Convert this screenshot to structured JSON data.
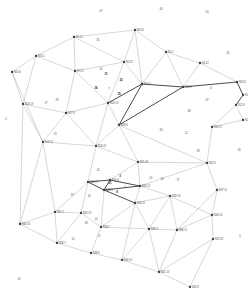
{
  "figure": {
    "kind": "planar-triangulated-graph",
    "background_color": "#ffffff",
    "edge_color": "#a8a8a8",
    "edge_color_highlight": "#2b2b2b",
    "node_color": "#3a3a3a",
    "label_color": "#4a4a4a",
    "width": 248,
    "height": 307
  },
  "chart_data": {
    "type": "scatter",
    "title": "",
    "xlabel": "",
    "ylabel": "",
    "grid": false,
    "legend": "none",
    "xlim": [
      0,
      248
    ],
    "ylim": [
      0,
      307
    ],
    "nodes": [
      {
        "id": 0,
        "label": "N0:20",
        "x": 135,
        "y": 30
      },
      {
        "id": 1,
        "label": "N1:12",
        "x": 74,
        "y": 37
      },
      {
        "id": 2,
        "label": "N2:4",
        "x": 166,
        "y": 52
      },
      {
        "id": 3,
        "label": "N3:11",
        "x": 36,
        "y": 56
      },
      {
        "id": 4,
        "label": "N4:22",
        "x": 200,
        "y": 63
      },
      {
        "id": 5,
        "label": "N5:22",
        "x": 124,
        "y": 62
      },
      {
        "id": 6,
        "label": "N6:16",
        "x": 12,
        "y": 72
      },
      {
        "id": 7,
        "label": "N7:21",
        "x": 75,
        "y": 71
      },
      {
        "id": 8,
        "label": "N8:16",
        "x": 237,
        "y": 82
      },
      {
        "id": 9,
        "label": "N9:10",
        "x": 142,
        "y": 84
      },
      {
        "id": 10,
        "label": "N10:17",
        "x": 243,
        "y": 95
      },
      {
        "id": 11,
        "label": "N11:9",
        "x": 183,
        "y": 87
      },
      {
        "id": 12,
        "label": "N12:9",
        "x": 236,
        "y": 105
      },
      {
        "id": 13,
        "label": "N13:13",
        "x": 23,
        "y": 104
      },
      {
        "id": 14,
        "label": "N14:19",
        "x": 108,
        "y": 103
      },
      {
        "id": 15,
        "label": "N15:25",
        "x": 243,
        "y": 120
      },
      {
        "id": 16,
        "label": "N16:17",
        "x": 212,
        "y": 127
      },
      {
        "id": 17,
        "label": "N17:8",
        "x": 66,
        "y": 113
      },
      {
        "id": 18,
        "label": "N18:6",
        "x": 119,
        "y": 125
      },
      {
        "id": 19,
        "label": "N19:15",
        "x": 43,
        "y": 142
      },
      {
        "id": 20,
        "label": "N20:22",
        "x": 96,
        "y": 146
      },
      {
        "id": 21,
        "label": "N21:20",
        "x": 138,
        "y": 162
      },
      {
        "id": 22,
        "label": "N22:5",
        "x": 207,
        "y": 163
      },
      {
        "id": 23,
        "label": "N23:17",
        "x": 88,
        "y": 182
      },
      {
        "id": 24,
        "label": "N24:4",
        "x": 110,
        "y": 180
      },
      {
        "id": 25,
        "label": "N25:9",
        "x": 104,
        "y": 190
      },
      {
        "id": 26,
        "label": "N26:12",
        "x": 140,
        "y": 186
      },
      {
        "id": 27,
        "label": "N27:11",
        "x": 217,
        "y": 190
      },
      {
        "id": 28,
        "label": "N28:18",
        "x": 170,
        "y": 196
      },
      {
        "id": 29,
        "label": "N29:21",
        "x": 135,
        "y": 203
      },
      {
        "id": 30,
        "label": "N30:14",
        "x": 212,
        "y": 215
      },
      {
        "id": 31,
        "label": "N31:2",
        "x": 55,
        "y": 212
      },
      {
        "id": 32,
        "label": "N32:13",
        "x": 81,
        "y": 213
      },
      {
        "id": 33,
        "label": "N33:7",
        "x": 101,
        "y": 227
      },
      {
        "id": 34,
        "label": "N34:16",
        "x": 20,
        "y": 224
      },
      {
        "id": 35,
        "label": "N35:3",
        "x": 149,
        "y": 229
      },
      {
        "id": 36,
        "label": "N36:11",
        "x": 177,
        "y": 230
      },
      {
        "id": 37,
        "label": "N37:22",
        "x": 213,
        "y": 239
      },
      {
        "id": 38,
        "label": "N38:7",
        "x": 57,
        "y": 243
      },
      {
        "id": 39,
        "label": "N39:9",
        "x": 91,
        "y": 253
      },
      {
        "id": 40,
        "label": "N40:10",
        "x": 122,
        "y": 260
      },
      {
        "id": 41,
        "label": "N41:23",
        "x": 159,
        "y": 272
      },
      {
        "id": 42,
        "label": "N42:8",
        "x": 190,
        "y": 287
      }
    ],
    "edges": [
      {
        "from": 0,
        "to": 1,
        "weight": 1
      },
      {
        "from": 0,
        "to": 2,
        "weight": 1
      },
      {
        "from": 0,
        "to": 5,
        "weight": 1
      },
      {
        "from": 0,
        "to": 9,
        "weight": 1
      },
      {
        "from": 1,
        "to": 3,
        "weight": 1
      },
      {
        "from": 1,
        "to": 5,
        "weight": 1
      },
      {
        "from": 1,
        "to": 7,
        "weight": 1
      },
      {
        "from": 2,
        "to": 4,
        "weight": 1
      },
      {
        "from": 2,
        "to": 9,
        "weight": 1
      },
      {
        "from": 2,
        "to": 11,
        "weight": 1
      },
      {
        "from": 3,
        "to": 6,
        "weight": 1
      },
      {
        "from": 3,
        "to": 7,
        "weight": 1
      },
      {
        "from": 3,
        "to": 13,
        "weight": 1
      },
      {
        "from": 4,
        "to": 8,
        "weight": 1
      },
      {
        "from": 4,
        "to": 11,
        "weight": 1
      },
      {
        "from": 5,
        "to": 7,
        "weight": 1
      },
      {
        "from": 5,
        "to": 9,
        "weight": 1
      },
      {
        "from": 5,
        "to": 14,
        "weight": 1
      },
      {
        "from": 6,
        "to": 13,
        "weight": 1
      },
      {
        "from": 7,
        "to": 14,
        "weight": 1
      },
      {
        "from": 7,
        "to": 17,
        "weight": 1
      },
      {
        "from": 8,
        "to": 10,
        "weight": 2
      },
      {
        "from": 8,
        "to": 11,
        "weight": 2
      },
      {
        "from": 9,
        "to": 11,
        "weight": 2
      },
      {
        "from": 9,
        "to": 14,
        "weight": 2
      },
      {
        "from": 9,
        "to": 18,
        "weight": 2
      },
      {
        "from": 10,
        "to": 12,
        "weight": 2
      },
      {
        "from": 11,
        "to": 18,
        "weight": 2
      },
      {
        "from": 12,
        "to": 15,
        "weight": 1
      },
      {
        "from": 12,
        "to": 16,
        "weight": 1
      },
      {
        "from": 13,
        "to": 17,
        "weight": 1
      },
      {
        "from": 13,
        "to": 19,
        "weight": 1
      },
      {
        "from": 14,
        "to": 17,
        "weight": 1
      },
      {
        "from": 14,
        "to": 18,
        "weight": 1
      },
      {
        "from": 14,
        "to": 20,
        "weight": 1
      },
      {
        "from": 15,
        "to": 16,
        "weight": 1
      },
      {
        "from": 16,
        "to": 22,
        "weight": 1
      },
      {
        "from": 17,
        "to": 19,
        "weight": 1
      },
      {
        "from": 17,
        "to": 20,
        "weight": 1
      },
      {
        "from": 18,
        "to": 20,
        "weight": 1
      },
      {
        "from": 18,
        "to": 21,
        "weight": 1
      },
      {
        "from": 18,
        "to": 22,
        "weight": 1
      },
      {
        "from": 19,
        "to": 20,
        "weight": 1
      },
      {
        "from": 19,
        "to": 31,
        "weight": 1
      },
      {
        "from": 19,
        "to": 34,
        "weight": 1
      },
      {
        "from": 20,
        "to": 21,
        "weight": 1
      },
      {
        "from": 20,
        "to": 23,
        "weight": 1
      },
      {
        "from": 21,
        "to": 22,
        "weight": 1
      },
      {
        "from": 21,
        "to": 24,
        "weight": 1
      },
      {
        "from": 21,
        "to": 26,
        "weight": 1
      },
      {
        "from": 22,
        "to": 26,
        "weight": 1
      },
      {
        "from": 22,
        "to": 27,
        "weight": 1
      },
      {
        "from": 23,
        "to": 24,
        "weight": 2
      },
      {
        "from": 23,
        "to": 25,
        "weight": 2
      },
      {
        "from": 23,
        "to": 32,
        "weight": 1
      },
      {
        "from": 24,
        "to": 25,
        "weight": 2
      },
      {
        "from": 24,
        "to": 26,
        "weight": 2
      },
      {
        "from": 25,
        "to": 26,
        "weight": 2
      },
      {
        "from": 25,
        "to": 29,
        "weight": 2
      },
      {
        "from": 25,
        "to": 33,
        "weight": 1
      },
      {
        "from": 26,
        "to": 28,
        "weight": 1
      },
      {
        "from": 26,
        "to": 29,
        "weight": 1
      },
      {
        "from": 27,
        "to": 30,
        "weight": 1
      },
      {
        "from": 27,
        "to": 36,
        "weight": 1
      },
      {
        "from": 28,
        "to": 29,
        "weight": 1
      },
      {
        "from": 28,
        "to": 30,
        "weight": 1
      },
      {
        "from": 28,
        "to": 35,
        "weight": 1
      },
      {
        "from": 28,
        "to": 36,
        "weight": 1
      },
      {
        "from": 29,
        "to": 33,
        "weight": 1
      },
      {
        "from": 29,
        "to": 35,
        "weight": 1
      },
      {
        "from": 30,
        "to": 36,
        "weight": 1
      },
      {
        "from": 30,
        "to": 37,
        "weight": 1
      },
      {
        "from": 31,
        "to": 32,
        "weight": 1
      },
      {
        "from": 31,
        "to": 34,
        "weight": 1
      },
      {
        "from": 31,
        "to": 38,
        "weight": 1
      },
      {
        "from": 32,
        "to": 33,
        "weight": 1
      },
      {
        "from": 32,
        "to": 38,
        "weight": 1
      },
      {
        "from": 33,
        "to": 39,
        "weight": 1
      },
      {
        "from": 34,
        "to": 38,
        "weight": 1
      },
      {
        "from": 35,
        "to": 36,
        "weight": 1
      },
      {
        "from": 35,
        "to": 40,
        "weight": 1
      },
      {
        "from": 35,
        "to": 41,
        "weight": 1
      },
      {
        "from": 36,
        "to": 41,
        "weight": 1
      },
      {
        "from": 37,
        "to": 41,
        "weight": 1
      },
      {
        "from": 37,
        "to": 42,
        "weight": 1
      },
      {
        "from": 38,
        "to": 39,
        "weight": 1
      },
      {
        "from": 39,
        "to": 40,
        "weight": 1
      },
      {
        "from": 40,
        "to": 41,
        "weight": 1
      },
      {
        "from": 41,
        "to": 42,
        "weight": 1
      },
      {
        "from": 33,
        "to": 35,
        "weight": 1
      },
      {
        "from": 29,
        "to": 40,
        "weight": 1
      },
      {
        "from": 13,
        "to": 34,
        "weight": 1
      },
      {
        "from": 6,
        "to": 19,
        "weight": 1
      },
      {
        "from": 23,
        "to": 31,
        "weight": 1
      }
    ],
    "face_labels": [
      {
        "text": "47",
        "x": 101,
        "y": 12,
        "strong": false
      },
      {
        "text": "44",
        "x": 161,
        "y": 10,
        "strong": false
      },
      {
        "text": "50",
        "x": 207,
        "y": 13,
        "strong": false
      },
      {
        "text": "45",
        "x": 98,
        "y": 41,
        "strong": false
      },
      {
        "text": "42",
        "x": 228,
        "y": 54,
        "strong": false
      },
      {
        "text": "24",
        "x": 101,
        "y": 70,
        "strong": false
      },
      {
        "text": "31",
        "x": 106,
        "y": 75,
        "strong": true
      },
      {
        "text": "32",
        "x": 121,
        "y": 81,
        "strong": true
      },
      {
        "text": "36",
        "x": 96,
        "y": 89,
        "strong": true
      },
      {
        "text": "7",
        "x": 109,
        "y": 90,
        "strong": false
      },
      {
        "text": "35",
        "x": 119,
        "y": 95,
        "strong": true
      },
      {
        "text": "4",
        "x": 211,
        "y": 89,
        "strong": false
      },
      {
        "text": "37",
        "x": 207,
        "y": 101,
        "strong": false
      },
      {
        "text": "0",
        "x": 6,
        "y": 120,
        "strong": false
      },
      {
        "text": "29",
        "x": 57,
        "y": 101,
        "strong": false
      },
      {
        "text": "27",
        "x": 46,
        "y": 104,
        "strong": false
      },
      {
        "text": "23",
        "x": 55,
        "y": 135,
        "strong": false
      },
      {
        "text": "43",
        "x": 161,
        "y": 131,
        "strong": false
      },
      {
        "text": "12",
        "x": 186,
        "y": 134,
        "strong": false
      },
      {
        "text": "48",
        "x": 189,
        "y": 112,
        "strong": false
      },
      {
        "text": "28",
        "x": 198,
        "y": 152,
        "strong": false
      },
      {
        "text": "26",
        "x": 239,
        "y": 151,
        "strong": false
      },
      {
        "text": "22",
        "x": 98,
        "y": 171,
        "strong": false
      },
      {
        "text": "3",
        "x": 120,
        "y": 177,
        "strong": true
      },
      {
        "text": "21",
        "x": 110,
        "y": 184,
        "strong": true
      },
      {
        "text": "8",
        "x": 117,
        "y": 193,
        "strong": true
      },
      {
        "text": "1",
        "x": 125,
        "y": 188,
        "strong": false
      },
      {
        "text": "34",
        "x": 162,
        "y": 180,
        "strong": false
      },
      {
        "text": "17",
        "x": 178,
        "y": 181,
        "strong": false
      },
      {
        "text": "41",
        "x": 151,
        "y": 179,
        "strong": false
      },
      {
        "text": "19",
        "x": 72,
        "y": 196,
        "strong": false
      },
      {
        "text": "16",
        "x": 89,
        "y": 197,
        "strong": false
      },
      {
        "text": "18",
        "x": 86,
        "y": 224,
        "strong": false
      },
      {
        "text": "14",
        "x": 96,
        "y": 220,
        "strong": false
      },
      {
        "text": "11",
        "x": 99,
        "y": 237,
        "strong": false
      },
      {
        "text": "15",
        "x": 73,
        "y": 240,
        "strong": false
      },
      {
        "text": "6",
        "x": 240,
        "y": 237,
        "strong": false
      },
      {
        "text": "13",
        "x": 19,
        "y": 280,
        "strong": false
      }
    ]
  }
}
